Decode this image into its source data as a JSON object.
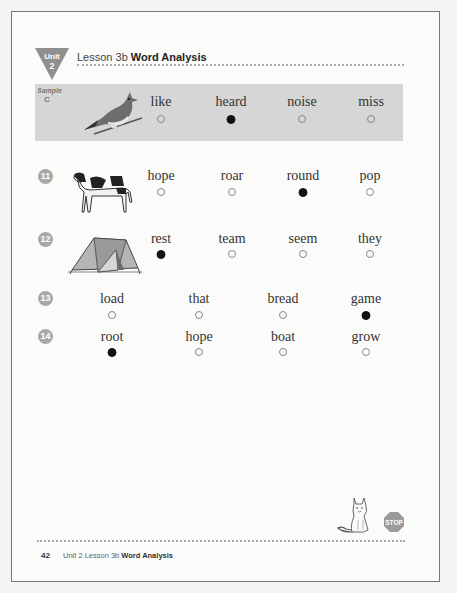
{
  "header": {
    "unit_badge_word": "Unit",
    "unit_badge_number": "2",
    "lesson": "Lesson 3b",
    "title": "Word Analysis"
  },
  "sample": {
    "label_top": "Sample",
    "label_letter": "C",
    "picture": "bird-icon",
    "options": [
      {
        "word": "like",
        "selected": false
      },
      {
        "word": "heard",
        "selected": true
      },
      {
        "word": "noise",
        "selected": false
      },
      {
        "word": "miss",
        "selected": false
      }
    ]
  },
  "questions": [
    {
      "number": "11",
      "picture": "cow-icon",
      "options": [
        {
          "word": "hope",
          "selected": false
        },
        {
          "word": "roar",
          "selected": false
        },
        {
          "word": "round",
          "selected": true
        },
        {
          "word": "pop",
          "selected": false
        }
      ]
    },
    {
      "number": "12",
      "picture": "tent-icon",
      "options": [
        {
          "word": "rest",
          "selected": true
        },
        {
          "word": "team",
          "selected": false
        },
        {
          "word": "seem",
          "selected": false
        },
        {
          "word": "they",
          "selected": false
        }
      ]
    },
    {
      "number": "13",
      "picture": null,
      "options": [
        {
          "word": "load",
          "selected": false
        },
        {
          "word": "that",
          "selected": false
        },
        {
          "word": "bread",
          "selected": false
        },
        {
          "word": "game",
          "selected": true
        }
      ]
    },
    {
      "number": "14",
      "picture": null,
      "options": [
        {
          "word": "root",
          "selected": true
        },
        {
          "word": "hope",
          "selected": false
        },
        {
          "word": "boat",
          "selected": false
        },
        {
          "word": "grow",
          "selected": false
        }
      ]
    }
  ],
  "stop_sign": "STOP",
  "footer": {
    "page_number": "42",
    "text": "Unit 2 Lesson 3b",
    "title": "Word Analysis"
  }
}
